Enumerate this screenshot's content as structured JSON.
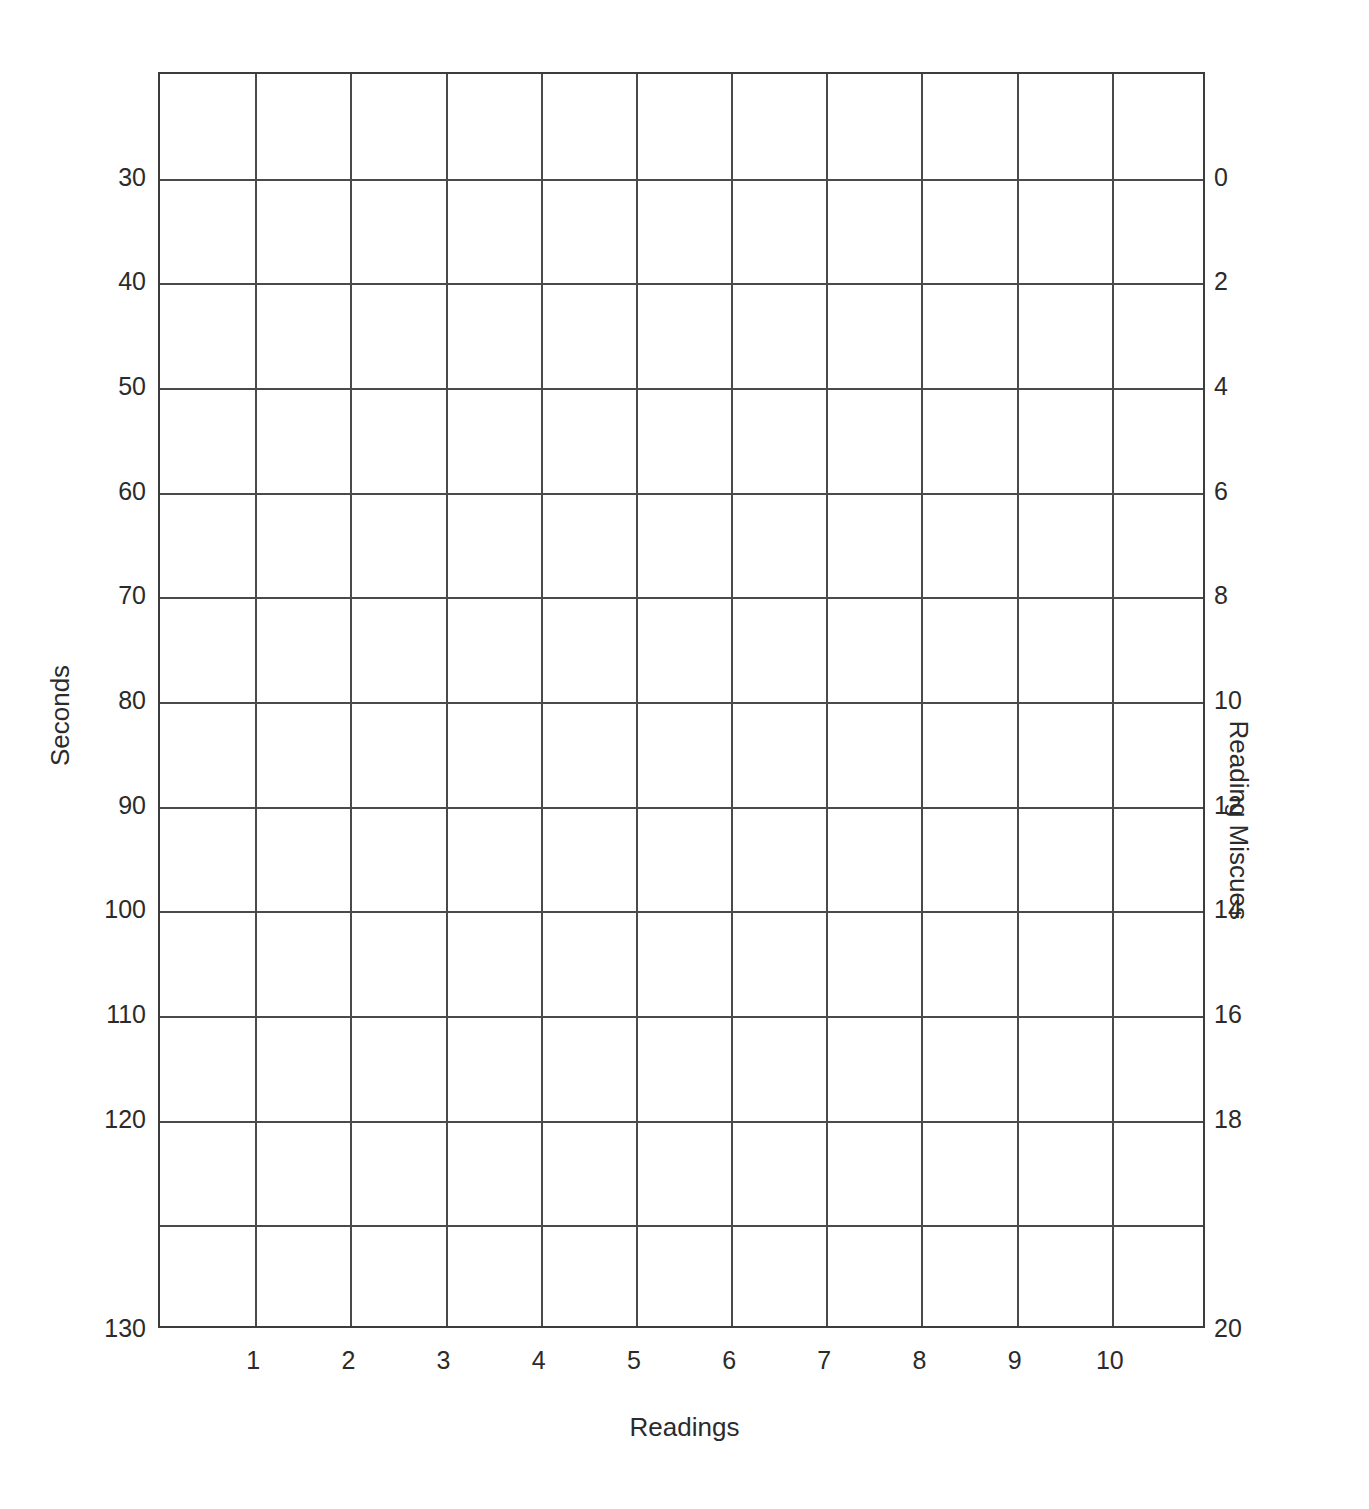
{
  "chart_data": {
    "type": "table",
    "title": "",
    "subtitle": "",
    "grid": true,
    "grid_columns": 11,
    "grid_rows": 12,
    "series": [],
    "x": [
      1,
      2,
      3,
      4,
      5,
      6,
      7,
      8,
      9,
      10
    ],
    "xlabel": "Readings",
    "x_tick_labels": [
      "1",
      "2",
      "3",
      "4",
      "5",
      "6",
      "7",
      "8",
      "9",
      "10"
    ],
    "xlim": [
      0,
      11
    ],
    "ylabel": "Seconds",
    "y_tick_labels": [
      "30",
      "40",
      "50",
      "60",
      "70",
      "80",
      "90",
      "100",
      "110",
      "120",
      "130"
    ],
    "y_values": [
      30,
      40,
      50,
      60,
      70,
      80,
      90,
      100,
      110,
      120,
      130
    ],
    "ylim": [
      20,
      130
    ],
    "y_inverted": true,
    "y2label": "Reading Miscues",
    "y2_tick_labels": [
      "0",
      "2",
      "4",
      "6",
      "8",
      "10",
      "12",
      "14",
      "16",
      "18",
      "20"
    ],
    "y2_values": [
      0,
      2,
      4,
      6,
      8,
      10,
      12,
      14,
      16,
      18,
      20
    ],
    "y2lim": [
      -2,
      20
    ],
    "y2_inverted": true,
    "legend": [],
    "legend_position": "none"
  },
  "axes": {
    "left": {
      "title": "Seconds",
      "ticks": [
        {
          "label": "30",
          "row": 1
        },
        {
          "label": "40",
          "row": 2
        },
        {
          "label": "50",
          "row": 3
        },
        {
          "label": "60",
          "row": 4
        },
        {
          "label": "70",
          "row": 5
        },
        {
          "label": "80",
          "row": 6
        },
        {
          "label": "90",
          "row": 7
        },
        {
          "label": "100",
          "row": 8
        },
        {
          "label": "110",
          "row": 9
        },
        {
          "label": "120",
          "row": 10
        },
        {
          "label": "130",
          "row": 12
        }
      ]
    },
    "right": {
      "title": "Reading Miscues",
      "ticks": [
        {
          "label": "0",
          "row": 1
        },
        {
          "label": "2",
          "row": 2
        },
        {
          "label": "4",
          "row": 3
        },
        {
          "label": "6",
          "row": 4
        },
        {
          "label": "8",
          "row": 5
        },
        {
          "label": "10",
          "row": 6
        },
        {
          "label": "12",
          "row": 7
        },
        {
          "label": "14",
          "row": 8
        },
        {
          "label": "16",
          "row": 9
        },
        {
          "label": "18",
          "row": 10
        },
        {
          "label": "20",
          "row": 12
        }
      ]
    },
    "bottom": {
      "title": "Readings",
      "ticks": [
        {
          "label": "1",
          "col": 1
        },
        {
          "label": "2",
          "col": 2
        },
        {
          "label": "3",
          "col": 3
        },
        {
          "label": "4",
          "col": 4
        },
        {
          "label": "5",
          "col": 5
        },
        {
          "label": "6",
          "col": 6
        },
        {
          "label": "7",
          "col": 7
        },
        {
          "label": "8",
          "col": 8
        },
        {
          "label": "9",
          "col": 9
        },
        {
          "label": "10",
          "col": 10
        }
      ]
    }
  },
  "style": {
    "background": "#ffffff",
    "grid_color": "#4a4a4a",
    "border_color": "#3c3c3c",
    "text_color": "#2b2b2b"
  }
}
